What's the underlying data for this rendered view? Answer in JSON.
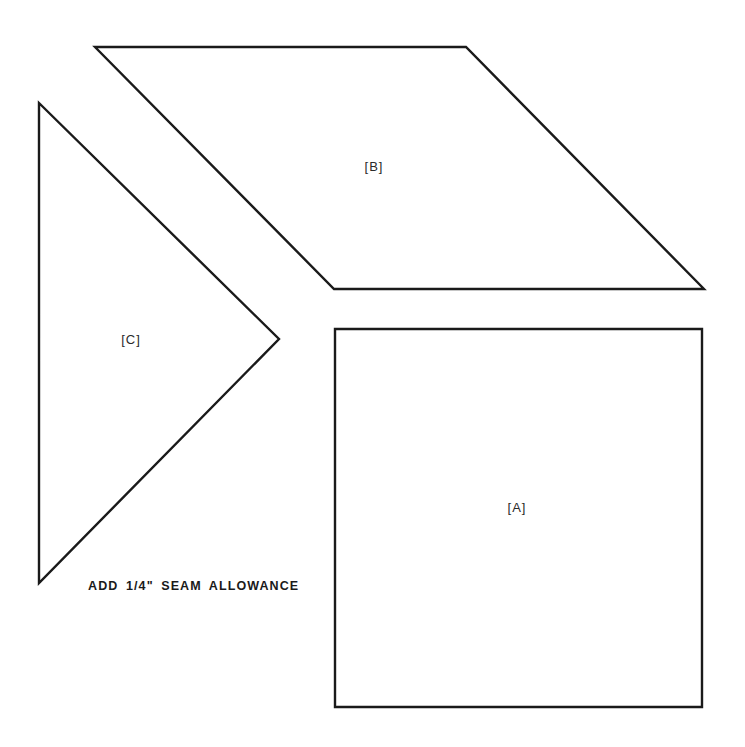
{
  "diagram": {
    "type": "quilt-pattern-template",
    "pieces": [
      {
        "id": "B",
        "label": "[B]",
        "shape": "parallelogram",
        "points": [
          [
            95,
            47
          ],
          [
            466,
            47
          ],
          [
            704,
            289
          ],
          [
            334,
            289
          ]
        ],
        "label_pos": [
          374,
          166
        ]
      },
      {
        "id": "C",
        "label": "[C]",
        "shape": "triangle",
        "points": [
          [
            39,
            103
          ],
          [
            279,
            339
          ],
          [
            39,
            583
          ]
        ],
        "label_pos": [
          131,
          339
        ]
      },
      {
        "id": "A",
        "label": "[A]",
        "shape": "square",
        "points": [
          [
            335,
            329
          ],
          [
            702,
            329
          ],
          [
            702,
            707
          ],
          [
            335,
            707
          ]
        ],
        "label_pos": [
          517,
          507
        ]
      }
    ],
    "note": "ADD 1/4\" SEAM ALLOWANCE",
    "colors": {
      "stroke": "#1a1a1a",
      "background": "#ffffff",
      "text": "#1a1a1a"
    }
  }
}
